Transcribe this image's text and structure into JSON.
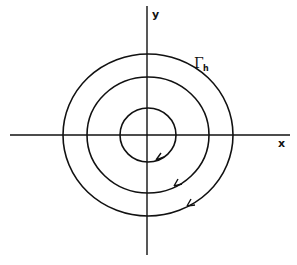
{
  "diagram": {
    "type": "phase-portrait-concentric-orbits",
    "axes": {
      "x_label": "x",
      "y_label": "y"
    },
    "curve_label": {
      "main": "Γ",
      "subscript": "h"
    },
    "orbits": [
      {
        "name": "inner",
        "direction": "clockwise"
      },
      {
        "name": "middle",
        "direction": "clockwise"
      },
      {
        "name": "outer",
        "direction": "clockwise",
        "labeled": "Γh"
      }
    ],
    "colors": {
      "stroke": "#111111",
      "background": "#ffffff"
    }
  }
}
